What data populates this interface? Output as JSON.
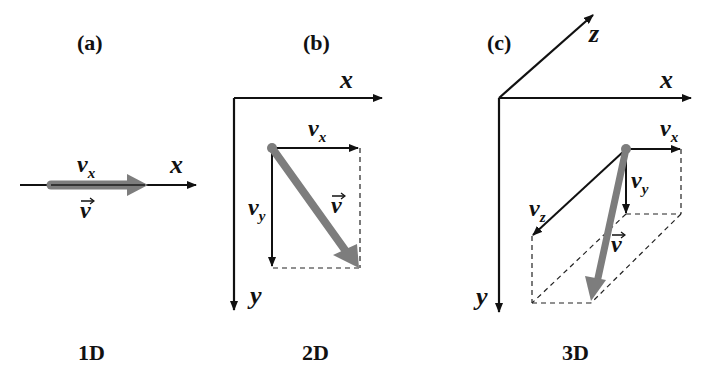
{
  "panels": [
    {
      "id": "a",
      "label": "(a)",
      "dimension": "1D",
      "axes": {
        "x": "x"
      },
      "components": {
        "vx": {
          "base": "v",
          "sub": "x"
        }
      },
      "vector": {
        "base": "v",
        "arrow": "⃗"
      }
    },
    {
      "id": "b",
      "label": "(b)",
      "dimension": "2D",
      "axes": {
        "x": "x",
        "y": "y"
      },
      "components": {
        "vx": {
          "base": "v",
          "sub": "x"
        },
        "vy": {
          "base": "v",
          "sub": "y"
        }
      },
      "vector": {
        "base": "v",
        "arrow": "⃗"
      }
    },
    {
      "id": "c",
      "label": "(c)",
      "dimension": "3D",
      "axes": {
        "x": "x",
        "y": "y",
        "z": "z"
      },
      "components": {
        "vx": {
          "base": "v",
          "sub": "x"
        },
        "vy": {
          "base": "v",
          "sub": "y"
        },
        "vz": {
          "base": "v",
          "sub": "z"
        }
      },
      "vector": {
        "base": "v",
        "arrow": "⃗"
      }
    }
  ],
  "colors": {
    "axis": "#111111",
    "vector": "#7d7d7d",
    "background": "#ffffff"
  }
}
